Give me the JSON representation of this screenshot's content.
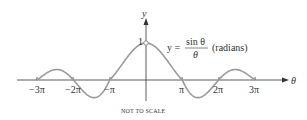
{
  "chart_data": {
    "type": "line",
    "title": "",
    "function": "y = sin(θ)/θ",
    "equation_label": {
      "lhs": "y =",
      "numerator": "sin θ",
      "denominator": "θ",
      "note": "(radians)"
    },
    "xlabel": "θ",
    "ylabel": "y",
    "x_tick_labels": [
      "−3π",
      "−2π",
      "−π",
      "π",
      "2π",
      "3π"
    ],
    "x_tick_values": [
      -9.4248,
      -6.2832,
      -3.1416,
      3.1416,
      6.2832,
      9.4248
    ],
    "y_tick_labels": [
      "1"
    ],
    "y_tick_values": [
      1
    ],
    "xlim": [
      -9.4248,
      9.4248
    ],
    "open_point": {
      "x": 0,
      "y": 1
    },
    "annotation": "NOT TO SCALE",
    "grid": false,
    "legend": "none"
  },
  "colors": {
    "curve": "#9a9a9a",
    "axis": "#333333",
    "text": "#333333"
  }
}
